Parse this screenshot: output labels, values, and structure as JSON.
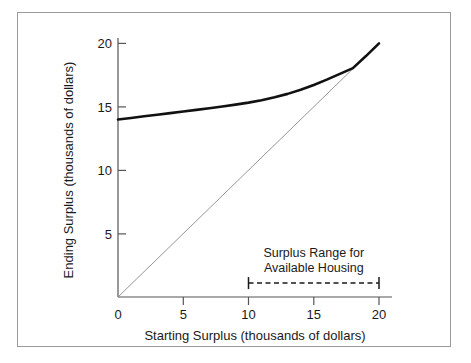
{
  "figure": {
    "frame_color": "#9a9a9a",
    "background": "#ffffff"
  },
  "chart_data": {
    "type": "line",
    "title": "",
    "xlabel": "Starting Surplus (thousands of dollars)",
    "ylabel": "Ending Surplus (thousands of dollars)",
    "xlim": [
      0,
      20
    ],
    "ylim": [
      0,
      20
    ],
    "xticks": [
      0,
      5,
      10,
      15,
      20
    ],
    "yticks": [
      0,
      5,
      10,
      15,
      20
    ],
    "xtick_labels": [
      "0",
      "5",
      "10",
      "15",
      "20"
    ],
    "ytick_labels": [
      "0",
      "5",
      "10",
      "15",
      "20"
    ],
    "grid": false,
    "legend": null,
    "series": [
      {
        "name": "Ending surplus policy function",
        "style": "solid-thick",
        "color": "#111111",
        "linewidth": 2.6,
        "x": [
          0,
          1,
          2,
          3,
          4,
          5,
          6,
          7,
          8,
          9,
          10,
          11,
          12,
          13,
          14,
          15,
          16,
          17,
          18,
          19,
          20
        ],
        "values": [
          14.0,
          14.12,
          14.25,
          14.37,
          14.5,
          14.63,
          14.76,
          14.89,
          15.02,
          15.17,
          15.33,
          15.52,
          15.75,
          16.02,
          16.34,
          16.72,
          17.14,
          17.6,
          18.05,
          19.0,
          20.0
        ]
      },
      {
        "name": "45 degree identity line",
        "style": "solid-thin",
        "color": "#8a8a8a",
        "linewidth": 0.9,
        "x": [
          0,
          20
        ],
        "values": [
          0,
          20
        ]
      }
    ],
    "annotations": [
      {
        "name": "surplus-range-annotation",
        "text_line1": "Surplus Range for",
        "text_line2": "Available Housing",
        "bar_style": "dashed-double-ended",
        "bar_x_start": 10,
        "bar_x_end": 20,
        "bar_y": 1.1,
        "color": "#1a1a1a"
      }
    ]
  }
}
